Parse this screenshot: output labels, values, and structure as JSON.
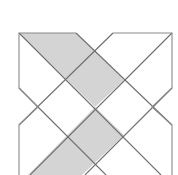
{
  "diagram": {
    "type": "geometric-tiling-pattern",
    "colors": {
      "background": "#ffffff",
      "stroke": "#8a8a8a",
      "stroke_dark": "#6e6e6e",
      "shade": "#d4d4d4"
    },
    "shaded_regions": [
      {
        "name": "upper-shaded-band",
        "points": "19,33 76,33 124,80 95,107"
      },
      {
        "name": "lower-shaded-band",
        "points": "95,107 124,135 82,175 28,175"
      }
    ],
    "outline_paths": [
      {
        "name": "left-outline",
        "points": "76,33 19,33 19,88 38,107 19,125 19,175"
      },
      {
        "name": "right-outline",
        "points": "113,33 172,33 172,88 152,107 172,125 172,175"
      }
    ],
    "lines": [
      {
        "name": "line-main-diagonal",
        "x1": 19,
        "y1": 33,
        "x2": 161,
        "y2": 175
      },
      {
        "name": "line-upper-right-diagonal",
        "x1": 76,
        "y1": 33,
        "x2": 172,
        "y2": 125
      },
      {
        "name": "line-anti-diagonal",
        "x1": 172,
        "y1": 33,
        "x2": 30,
        "y2": 175
      },
      {
        "name": "line-upper-left-anti",
        "x1": 113,
        "y1": 33,
        "x2": 19,
        "y2": 125
      },
      {
        "name": "line-lower-left-diagonal",
        "x1": 19,
        "y1": 88,
        "x2": 106,
        "y2": 175
      },
      {
        "name": "line-lower-right-anti",
        "x1": 172,
        "y1": 88,
        "x2": 85,
        "y2": 175
      }
    ]
  }
}
